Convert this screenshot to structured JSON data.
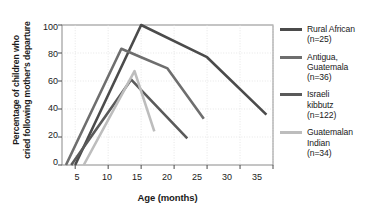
{
  "chart_data": {
    "type": "line",
    "title": "",
    "xlabel": "Age (months)",
    "ylabel_line1": "Percentage of children who",
    "ylabel_line2": "cried following mother's departure",
    "xlim": [
      3,
      35
    ],
    "ylim": [
      0,
      100
    ],
    "xticks": [
      5,
      10,
      15,
      20,
      25,
      30,
      35
    ],
    "yticks": [
      0,
      20,
      40,
      60,
      80,
      100
    ],
    "grid": true,
    "legend_position": "right",
    "series": [
      {
        "name": "Rural African",
        "n_label": "(n=25)",
        "color": "#4b4b4b",
        "x": [
          5,
          15,
          25,
          34
        ],
        "y": [
          0,
          100,
          77,
          36
        ]
      },
      {
        "name_line1": "Antigua,",
        "name_line2": "Guatemala",
        "name": "Antigua, Guatemala",
        "n_label": "(n=36)",
        "color": "#6e6e6e",
        "x": [
          3.6,
          12,
          15,
          19,
          24.5
        ],
        "y": [
          0,
          83,
          77,
          69,
          33
        ]
      },
      {
        "name_line1": "Israeli",
        "name_line2": "kibbutz",
        "name": "Israeli kibbutz",
        "n_label": "(n=122)",
        "color": "#5a5a5a",
        "x": [
          4.4,
          13.5,
          22
        ],
        "y": [
          0,
          61,
          19
        ]
      },
      {
        "name_line1": "Guatemalan",
        "name_line2": "Indian",
        "name": "Guatemalan Indian",
        "n_label": "(n=34)",
        "color": "#bdbdbd",
        "x": [
          6.3,
          14,
          17
        ],
        "y": [
          0,
          67,
          24
        ]
      }
    ]
  },
  "axis": {
    "ytick_labels": [
      "100",
      "80",
      "60",
      "40",
      "20",
      "0"
    ],
    "xtick_labels": [
      "5",
      "10",
      "15",
      "20",
      "25",
      "30",
      "35"
    ],
    "xlabel": "Age (months)",
    "ylabel_line1": "Percentage of children who",
    "ylabel_line2": "cried following mother's departure"
  },
  "legend": {
    "items": [
      {
        "line1": "Rural African",
        "line2": "(n=25)",
        "line3": "",
        "color": "#4b4b4b"
      },
      {
        "line1": "Antigua,",
        "line2": "Guatemala",
        "line3": "(n=36)",
        "color": "#6e6e6e"
      },
      {
        "line1": "Israeli",
        "line2": "kibbutz",
        "line3": "(n=122)",
        "color": "#5a5a5a"
      },
      {
        "line1": "Guatemalan",
        "line2": "Indian",
        "line3": "(n=34)",
        "color": "#bdbdbd"
      }
    ]
  }
}
